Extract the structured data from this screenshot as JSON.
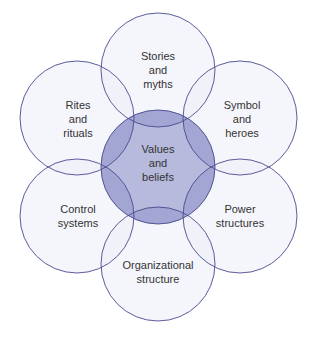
{
  "diagram": {
    "title": "",
    "colors": {
      "stroke": "#4a4a8f",
      "outer_fill": "#eef0f8",
      "overlap_fill": "#dcdfee",
      "center_fill": "#b7b9dd",
      "text": "#333333"
    },
    "center": {
      "lines": [
        "Values",
        "and",
        "beliefs"
      ]
    },
    "outer": [
      {
        "id": "stories",
        "lines": [
          "Stories",
          "and",
          "myths"
        ]
      },
      {
        "id": "symbol",
        "lines": [
          "Symbol",
          "and",
          "heroes"
        ]
      },
      {
        "id": "power",
        "lines": [
          "Power",
          "structures"
        ]
      },
      {
        "id": "organizational",
        "lines": [
          "Organizational",
          "structure"
        ]
      },
      {
        "id": "control",
        "lines": [
          "Control",
          "systems"
        ]
      },
      {
        "id": "rites",
        "lines": [
          "Rites",
          "and",
          "rituals"
        ]
      }
    ]
  }
}
